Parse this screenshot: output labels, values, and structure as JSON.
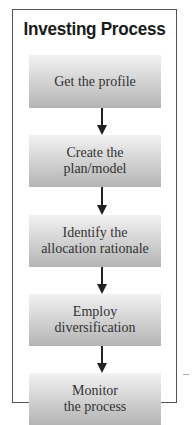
{
  "diagram": {
    "title": "Investing Process",
    "steps": [
      {
        "label": "Get the profile"
      },
      {
        "label": "Create the\nplan/model"
      },
      {
        "label": "Identify the\nallocation rationale"
      },
      {
        "label": "Employ\ndiversification"
      },
      {
        "label": "Monitor\nthe process"
      }
    ],
    "connectors": [
      "arrow-down",
      "arrow-down",
      "arrow-down",
      "arrow-down"
    ],
    "colors": {
      "frame_border": "#555555",
      "box_top": "#f2f2f2",
      "box_bottom": "#b4b4b4",
      "text": "#333333",
      "arrow": "#222222"
    }
  }
}
